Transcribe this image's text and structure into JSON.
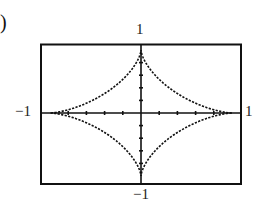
{
  "figure": {
    "panel_label": ")"
  },
  "chart_data": {
    "type": "line",
    "title": "",
    "equation": "x^(2/3) + y^(2/3) = 1",
    "xlabel": "",
    "ylabel": "",
    "xlim": [
      -1,
      1
    ],
    "ylim": [
      -1,
      1
    ],
    "grid": false,
    "legend": null,
    "tick_spacing": 0.2,
    "tick_labels": {
      "top": "1",
      "bottom": "−1",
      "left": "−1",
      "right": "1"
    },
    "key_points": [
      {
        "x": 1,
        "y": 0,
        "note": "cusp"
      },
      {
        "x": 0,
        "y": 1,
        "note": "cusp"
      },
      {
        "x": -1,
        "y": 0,
        "note": "cusp"
      },
      {
        "x": 0,
        "y": -1,
        "note": "cusp"
      }
    ],
    "series": [
      {
        "name": "astroid",
        "style": "dotted",
        "color": "#111111",
        "parametric": "x = cos^3(t), y = sin^3(t), t in [0, 2pi]",
        "sample_points": [
          {
            "x": 1.0,
            "y": 0.0
          },
          {
            "x": 0.65,
            "y": 0.044
          },
          {
            "x": 0.354,
            "y": 0.354
          },
          {
            "x": 0.044,
            "y": 0.65
          },
          {
            "x": 0.0,
            "y": 1.0
          },
          {
            "x": -0.044,
            "y": 0.65
          },
          {
            "x": -0.354,
            "y": 0.354
          },
          {
            "x": -0.65,
            "y": 0.044
          },
          {
            "x": -1.0,
            "y": 0.0
          },
          {
            "x": -0.65,
            "y": -0.044
          },
          {
            "x": -0.354,
            "y": -0.354
          },
          {
            "x": -0.044,
            "y": -0.65
          },
          {
            "x": 0.0,
            "y": -1.0
          },
          {
            "x": 0.044,
            "y": -0.65
          },
          {
            "x": 0.354,
            "y": -0.354
          },
          {
            "x": 0.65,
            "y": -0.044
          },
          {
            "x": 1.0,
            "y": 0.0
          }
        ]
      }
    ]
  }
}
